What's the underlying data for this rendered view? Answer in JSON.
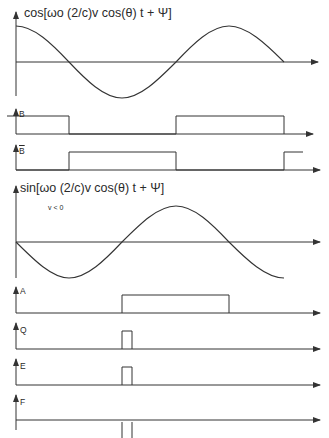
{
  "diagram": {
    "stroke_color": "#333333",
    "background": "#ffffff",
    "cos_plot": {
      "label": "cos[ωo (2/c)v cos(θ) t + Ψ]"
    },
    "signal_B": {
      "label": "B",
      "high_intervals": [
        [
          7,
          69
        ],
        [
          176,
          284
        ]
      ]
    },
    "signal_B_bar": {
      "label": "B",
      "overline": true,
      "high_intervals": [
        [
          69,
          176
        ],
        [
          284,
          303
        ]
      ]
    },
    "sin_plot": {
      "label": "sin[ωo (2/c)v cos(θ) t + Ψ]",
      "condition": "v < 0"
    },
    "signal_A": {
      "label": "A",
      "high_intervals": [
        [
          122,
          229
        ]
      ]
    },
    "signal_Q": {
      "label": "Q",
      "high_intervals": [
        [
          122,
          132
        ]
      ]
    },
    "signal_E": {
      "label": "E",
      "high_intervals": [
        [
          122,
          132
        ]
      ]
    },
    "signal_F": {
      "label": "F",
      "tick_marks": [
        122,
        132
      ]
    }
  }
}
